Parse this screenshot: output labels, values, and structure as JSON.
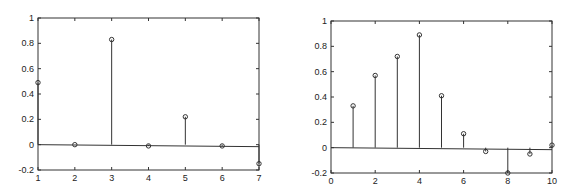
{
  "chart_data": [
    {
      "type": "stem",
      "title": "",
      "xlabel": "",
      "ylabel": "",
      "x": [
        1,
        2,
        3,
        4,
        5,
        6,
        7
      ],
      "values": [
        0.49,
        0.0,
        0.83,
        -0.01,
        0.22,
        -0.01,
        -0.15
      ],
      "xlim": [
        1,
        7
      ],
      "ylim": [
        -0.2,
        1
      ],
      "xticks": [
        "1",
        "2",
        "3",
        "4",
        "5",
        "6",
        "7"
      ],
      "yticks": [
        "-0.2",
        "0",
        "0.2",
        "0.4",
        "0.6",
        "0.8",
        "1"
      ],
      "grid": false,
      "legend": null
    },
    {
      "type": "stem",
      "title": "",
      "xlabel": "",
      "ylabel": "",
      "x": [
        1,
        2,
        3,
        4,
        5,
        6,
        7,
        8,
        9,
        10
      ],
      "values": [
        0.33,
        0.57,
        0.72,
        0.89,
        0.41,
        0.11,
        -0.03,
        -0.2,
        -0.05,
        0.02
      ],
      "xlim": [
        0,
        10
      ],
      "ylim": [
        -0.2,
        1
      ],
      "xticks": [
        "0",
        "2",
        "4",
        "6",
        "8",
        "10"
      ],
      "yticks": [
        "-0.2",
        "0",
        "0.2",
        "0.4",
        "0.6",
        "0.8",
        "1"
      ],
      "grid": false,
      "legend": null
    }
  ]
}
